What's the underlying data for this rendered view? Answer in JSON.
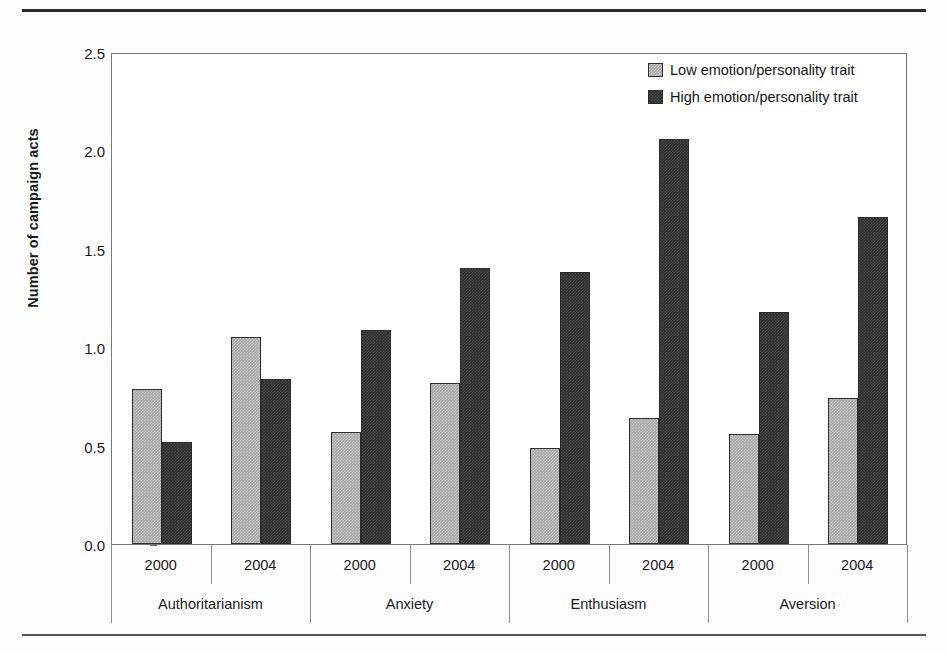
{
  "chart_data": {
    "type": "bar",
    "title": "",
    "xlabel": "",
    "ylabel": "Number of campaign acts",
    "ylim": [
      0.0,
      2.5
    ],
    "ytick_labels": [
      "0.0",
      "0.5",
      "1.0",
      "1.5",
      "2.0",
      "2.5"
    ],
    "ytick_values": [
      0.0,
      0.5,
      1.0,
      1.5,
      2.0,
      2.5
    ],
    "grid": false,
    "legend_position": "top-right",
    "group_labels": [
      "Authoritarianism",
      "Anxiety",
      "Enthusiasm",
      "Aversion"
    ],
    "year_labels": [
      "2000",
      "2004",
      "2000",
      "2004",
      "2000",
      "2004",
      "2000",
      "2004"
    ],
    "categories": [
      "Authoritarianism 2000",
      "Authoritarianism 2004",
      "Anxiety 2000",
      "Anxiety 2004",
      "Enthusiasm 2000",
      "Enthusiasm 2004",
      "Aversion 2000",
      "Aversion 2004"
    ],
    "series": [
      {
        "name": "Low emotion/personality trait",
        "color": "#a9a9a9",
        "values": [
          0.79,
          1.05,
          0.57,
          0.82,
          0.49,
          0.64,
          0.56,
          0.74
        ]
      },
      {
        "name": "High emotion/personality trait",
        "color": "#303030",
        "values": [
          0.52,
          0.84,
          1.09,
          1.4,
          1.38,
          2.06,
          1.18,
          1.66
        ]
      }
    ]
  },
  "legend": {
    "items": [
      {
        "label": "Low emotion/personality trait",
        "swatch": "low"
      },
      {
        "label": "High emotion/personality trait",
        "swatch": "high"
      }
    ]
  },
  "axis": {
    "y_title": "Number of campaign acts"
  }
}
